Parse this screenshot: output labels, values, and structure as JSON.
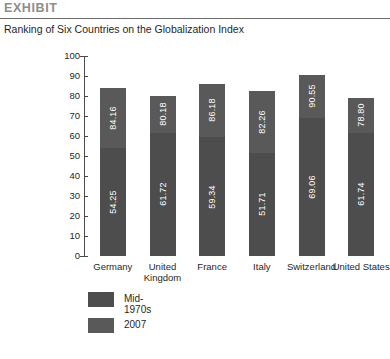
{
  "header": {
    "exhibit_label": "EXHIBIT",
    "subtitle": "Ranking of Six Countries on the Globalization Index"
  },
  "legend": {
    "items": [
      {
        "label": "Mid-1970s",
        "color": "#4d4d4d"
      },
      {
        "label": "2007",
        "color": "#595959"
      }
    ]
  },
  "bleed_text": {
    "top": "",
    "mid": "",
    "bottom1": "",
    "bottom2": ""
  },
  "chart_data": {
    "type": "bar",
    "subtype": "stacked-bar",
    "title": "Ranking of Six Countries on the Globalization Index",
    "xlabel": "",
    "ylabel": "",
    "ylim": [
      0,
      100
    ],
    "yticks": [
      0,
      10,
      20,
      30,
      40,
      50,
      60,
      70,
      80,
      90,
      100
    ],
    "grid": false,
    "legend_position": "bottom-left",
    "categories": [
      "Germany",
      "United Kingdom",
      "France",
      "Italy",
      "Switzerland",
      "United States"
    ],
    "series": [
      {
        "name": "Mid-1970s",
        "color": "#4d4d4d",
        "values": [
          54.25,
          61.72,
          59.34,
          51.71,
          69.06,
          61.74
        ]
      },
      {
        "name": "2007",
        "color": "#595959",
        "values": [
          84.16,
          80.18,
          86.18,
          82.26,
          90.55,
          78.8
        ]
      }
    ],
    "note": "Each bar is drawn to the 2007 total height; the Mid-1970s value marks the lower shaded portion and the 2007 value labels the upper portion."
  }
}
